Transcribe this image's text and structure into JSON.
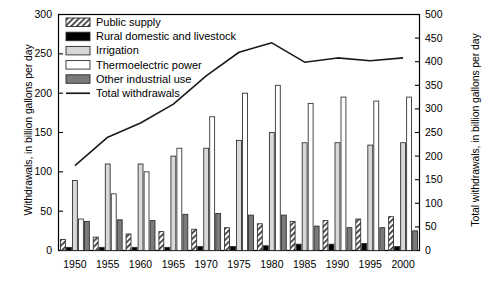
{
  "chart_data": {
    "type": "bar",
    "title": "",
    "xlabel": "",
    "ylabel": "Withdrawals, in billion gallons per day",
    "ylabel_right": "Total withdrawals, in billion gallons per day",
    "categories": [
      "1950",
      "1955",
      "1960",
      "1965",
      "1970",
      "1975",
      "1980",
      "1985",
      "1990",
      "1995",
      "2000"
    ],
    "ylim": [
      0,
      300
    ],
    "yticks": [
      0,
      50,
      100,
      150,
      200,
      250,
      300
    ],
    "ylim_right": [
      0,
      500
    ],
    "yticks_right": [
      0,
      50,
      100,
      150,
      200,
      250,
      300,
      350,
      400,
      450,
      500
    ],
    "grid": false,
    "legend_position": "upper-left-inside",
    "series": [
      {
        "name": "Public supply",
        "axis": "left",
        "pattern": "diagonal-hatch",
        "values": [
          14,
          17,
          21,
          24,
          27,
          29,
          34,
          37,
          38,
          40,
          43
        ]
      },
      {
        "name": "Rural domestic and livestock",
        "axis": "left",
        "pattern": "solid-black",
        "values": [
          4,
          4,
          4,
          4,
          5,
          5,
          6,
          8,
          8,
          9,
          5
        ]
      },
      {
        "name": "Irrigation",
        "axis": "left",
        "pattern": "light-gray",
        "values": [
          89,
          110,
          110,
          120,
          130,
          140,
          150,
          137,
          137,
          134,
          137
        ]
      },
      {
        "name": "Thermoelectric power",
        "axis": "left",
        "pattern": "white",
        "values": [
          40,
          72,
          100,
          130,
          170,
          200,
          210,
          187,
          195,
          190,
          195
        ]
      },
      {
        "name": "Other industrial use",
        "axis": "left",
        "pattern": "dark-gray",
        "values": [
          37,
          39,
          38,
          46,
          47,
          45,
          45,
          31,
          29,
          29,
          25
        ]
      },
      {
        "name": "Total withdrawals",
        "axis": "right",
        "pattern": "line",
        "values": [
          180,
          240,
          270,
          310,
          370,
          420,
          440,
          399,
          408,
          402,
          408
        ]
      }
    ]
  },
  "legend": {
    "items": [
      {
        "label": "Public supply",
        "swatch": "diagonal-hatch"
      },
      {
        "label": "Rural domestic and livestock",
        "swatch": "solid-black"
      },
      {
        "label": "Irrigation",
        "swatch": "light-gray"
      },
      {
        "label": "Thermoelectric power",
        "swatch": "white"
      },
      {
        "label": "Other industrial use",
        "swatch": "dark-gray"
      },
      {
        "label": "Total withdrawals",
        "swatch": "line"
      }
    ]
  },
  "colors": {
    "axis": "#000000",
    "light_gray": "#d8d8d8",
    "dark_gray": "#7a7a7a",
    "white": "#ffffff",
    "black": "#000000",
    "line": "#1a1a1a"
  }
}
